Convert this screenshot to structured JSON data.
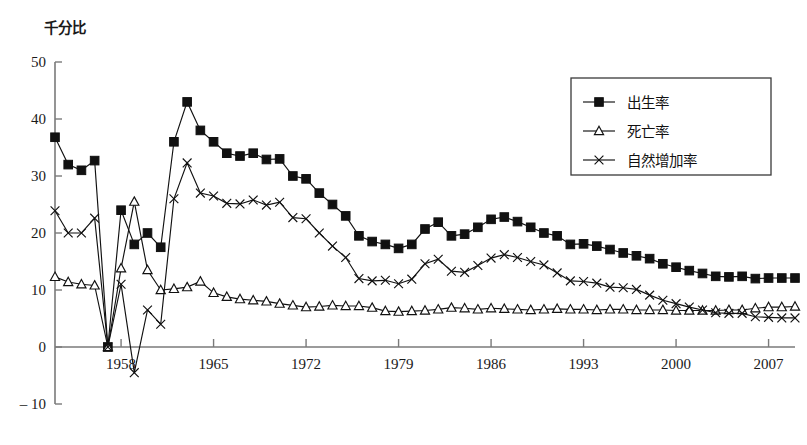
{
  "chart_data": {
    "type": "line",
    "title": "",
    "subtitle": "",
    "unit_label": "千分比",
    "xlabel": "",
    "ylabel": "",
    "grid": false,
    "legend_position": "top-right",
    "xlim": [
      1953,
      2009
    ],
    "ylim": [
      -10,
      50
    ],
    "y_ticks": [
      -10,
      0,
      10,
      20,
      30,
      40,
      50
    ],
    "x_ticks": [
      1958,
      1965,
      1972,
      1979,
      1986,
      1993,
      2000,
      2007
    ],
    "x": [
      1953,
      1954,
      1955,
      1956,
      1957,
      1958,
      1959,
      1960,
      1961,
      1962,
      1963,
      1964,
      1965,
      1966,
      1967,
      1968,
      1969,
      1970,
      1971,
      1972,
      1973,
      1974,
      1975,
      1976,
      1977,
      1978,
      1979,
      1980,
      1981,
      1982,
      1983,
      1984,
      1985,
      1986,
      1987,
      1988,
      1989,
      1990,
      1991,
      1992,
      1993,
      1994,
      1995,
      1996,
      1997,
      1998,
      1999,
      2000,
      2001,
      2002,
      2003,
      2004,
      2005,
      2006,
      2007,
      2008,
      2009
    ],
    "series": [
      {
        "name": "出生率",
        "marker": "filled-square",
        "values": [
          36.8,
          32.0,
          31.0,
          32.7,
          0,
          24.0,
          18.0,
          20.0,
          17.5,
          36.0,
          43.0,
          38.0,
          36.0,
          34.0,
          33.5,
          34.0,
          32.9,
          33.0,
          30.0,
          29.5,
          27.0,
          25.0,
          23.0,
          19.5,
          18.5,
          18.0,
          17.3,
          18.0,
          20.7,
          21.9,
          19.5,
          19.8,
          21.0,
          22.4,
          22.8,
          22.0,
          21.0,
          20.0,
          19.5,
          18.0,
          18.1,
          17.7,
          17.1,
          16.5,
          16.0,
          15.5,
          14.6,
          14.0,
          13.4,
          12.9,
          12.4,
          12.3,
          12.4,
          12.0,
          12.1,
          12.1,
          12.1
        ]
      },
      {
        "name": "死亡率",
        "marker": "open-triangle",
        "values": [
          12.3,
          11.4,
          11.0,
          10.8,
          0,
          13.8,
          25.5,
          13.5,
          10.0,
          10.2,
          10.5,
          11.5,
          9.5,
          8.8,
          8.4,
          8.2,
          8.0,
          7.6,
          7.3,
          7.0,
          7.1,
          7.3,
          7.2,
          7.2,
          6.9,
          6.3,
          6.2,
          6.3,
          6.4,
          6.6,
          6.9,
          6.8,
          6.6,
          6.8,
          6.7,
          6.6,
          6.5,
          6.6,
          6.7,
          6.6,
          6.6,
          6.5,
          6.6,
          6.6,
          6.5,
          6.5,
          6.5,
          6.4,
          6.4,
          6.4,
          6.4,
          6.5,
          6.5,
          6.8,
          7.0,
          7.0,
          7.1
        ]
      },
      {
        "name": "自然增加率",
        "marker": "x-cross",
        "values": [
          23.9,
          20.0,
          20.0,
          22.6,
          0,
          11.0,
          -4.5,
          6.5,
          4.0,
          26.0,
          32.3,
          27.0,
          26.5,
          25.2,
          25.1,
          25.8,
          24.9,
          25.4,
          22.7,
          22.5,
          20.0,
          17.7,
          15.7,
          12.0,
          11.6,
          11.7,
          11.1,
          11.9,
          14.6,
          15.4,
          13.3,
          13.1,
          14.3,
          15.6,
          16.2,
          15.7,
          15.0,
          14.4,
          13.0,
          11.6,
          11.5,
          11.2,
          10.5,
          10.4,
          10.1,
          9.1,
          8.2,
          7.6,
          7.0,
          6.5,
          6.0,
          5.9,
          5.9,
          5.3,
          5.2,
          5.1,
          5.1
        ]
      }
    ]
  },
  "legend": {
    "entries": [
      {
        "label": "出生率",
        "marker": "filled-square"
      },
      {
        "label": "死亡率",
        "marker": "open-triangle"
      },
      {
        "label": "自然增加率",
        "marker": "x-cross"
      }
    ]
  },
  "axis": {
    "unit_label": "千分比"
  }
}
